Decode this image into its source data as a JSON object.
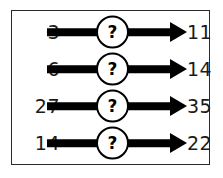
{
  "diagram": {
    "type": "function-machine-puzzle",
    "frame": {
      "border_color": "#2a2a2a",
      "background_color": "#ffffff"
    },
    "arrow_color": "#000000",
    "node_symbol": "?",
    "rows": [
      {
        "input": "3",
        "output": "11",
        "node": "?"
      },
      {
        "input": "6",
        "output": "14",
        "node": "?"
      },
      {
        "input": "27",
        "output": "35",
        "node": "?"
      },
      {
        "input": "14",
        "output": "22",
        "node": "?"
      }
    ]
  },
  "chart_data": {
    "type": "table",
    "title": "",
    "categories": [
      "input",
      "operation",
      "output"
    ],
    "series": [
      {
        "name": "row-1",
        "values": [
          "3",
          "?",
          "11"
        ]
      },
      {
        "name": "row-2",
        "values": [
          "6",
          "?",
          "14"
        ]
      },
      {
        "name": "row-3",
        "values": [
          "27",
          "?",
          "35"
        ]
      },
      {
        "name": "row-4",
        "values": [
          "14",
          "?",
          "22"
        ]
      }
    ]
  }
}
